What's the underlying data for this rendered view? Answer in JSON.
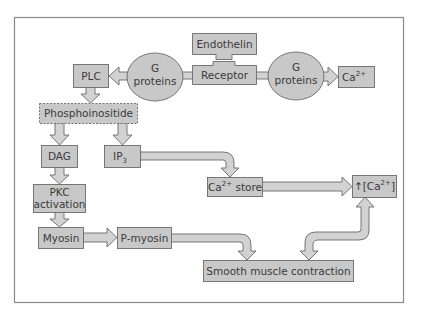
{
  "diagram": {
    "type": "flowchart",
    "title": "",
    "colors": {
      "box_fill": "#c8c8c8",
      "box_stroke": "#6a6a6a",
      "arrow_fill": "#d2d2d2",
      "frame_stroke": "#8a8a8a",
      "text": "#3a3a3a",
      "background": "#ffffff"
    },
    "nodes": {
      "endothelin": {
        "label": "Endothelin"
      },
      "receptor": {
        "label": "Receptor"
      },
      "g_proteins_left": {
        "line1": "G",
        "line2": "proteins"
      },
      "g_proteins_right": {
        "line1": "G",
        "line2": "proteins"
      },
      "plc": {
        "label": "PLC"
      },
      "ca_top": {
        "base": "Ca",
        "sup": "2+"
      },
      "phosphoinositide": {
        "label": "Phosphoinositide"
      },
      "dag": {
        "label": "DAG"
      },
      "ip3": {
        "base": "IP",
        "sub": "3"
      },
      "pkc": {
        "line1": "PKC",
        "line2": "activation"
      },
      "ca_store": {
        "base": "Ca",
        "sup": "2+",
        "suffix": " store"
      },
      "ca_increase": {
        "prefix": "↑[Ca",
        "sup": "2+",
        "suffix": "]"
      },
      "myosin": {
        "label": "Myosin"
      },
      "p_myosin": {
        "label": "P-myosin"
      },
      "smooth_muscle": {
        "label": "Smooth muscle contraction"
      }
    },
    "edges": [
      {
        "from": "Endothelin",
        "to": "Receptor",
        "kind": "binds"
      },
      {
        "from": "Receptor",
        "to": "G proteins (left)"
      },
      {
        "from": "G proteins (left)",
        "to": "PLC"
      },
      {
        "from": "Receptor",
        "to": "G proteins (right)"
      },
      {
        "from": "G proteins (right)",
        "to": "Ca2+"
      },
      {
        "from": "PLC",
        "to": "Phosphoinositide"
      },
      {
        "from": "Phosphoinositide",
        "to": "DAG"
      },
      {
        "from": "Phosphoinositide",
        "to": "IP3"
      },
      {
        "from": "DAG",
        "to": "PKC activation"
      },
      {
        "from": "PKC activation",
        "to": "Myosin"
      },
      {
        "from": "Myosin",
        "to": "P-myosin"
      },
      {
        "from": "P-myosin",
        "to": "Smooth muscle contraction"
      },
      {
        "from": "IP3",
        "to": "Ca2+ store"
      },
      {
        "from": "Ca2+ store",
        "to": "↑[Ca2+]"
      },
      {
        "from": "↑[Ca2+]",
        "to": "Smooth muscle contraction",
        "kind": "bidirectional"
      }
    ]
  }
}
